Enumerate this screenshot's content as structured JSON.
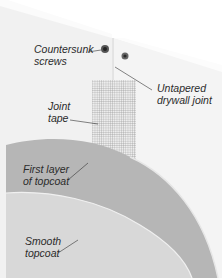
{
  "diagram": {
    "labels": {
      "countersunk_screws": [
        "Countersunk",
        "screws"
      ],
      "untapered_joint": [
        "Untapered",
        "drywall joint"
      ],
      "joint_tape": [
        "Joint",
        "tape"
      ],
      "first_layer": [
        "First layer",
        "of topcoat"
      ],
      "smooth_topcoat": [
        "Smooth",
        "topcoat"
      ]
    },
    "colors": {
      "board": "#f2f2f2",
      "board_edge": "#fafafa",
      "first_layer": "#b4b4b4",
      "smooth_topcoat": "#d6d6d6",
      "tape_mesh": "#9a9a9a",
      "leader": "#333333"
    }
  }
}
